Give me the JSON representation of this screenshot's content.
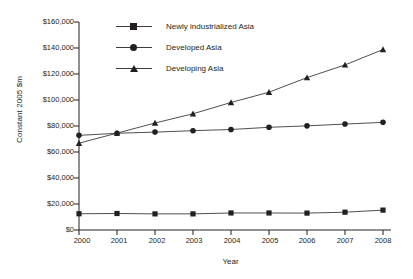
{
  "chart_data": {
    "type": "line",
    "title": "",
    "xlabel": "Year",
    "ylabel": "Constant 2005 $m",
    "x": [
      2000,
      2001,
      2002,
      2003,
      2004,
      2005,
      2006,
      2007,
      2008
    ],
    "xtick_labels": [
      "2000",
      "2001",
      "2002",
      "2003",
      "2004",
      "2005",
      "2006",
      "2007",
      "2008"
    ],
    "ytick_labels": [
      "$160,000",
      "$140,000",
      "$120,000",
      "$100,000",
      "$80,000",
      "$60,000",
      "$40,000",
      "$20,000",
      "$0"
    ],
    "ytick_values": [
      160000,
      140000,
      120000,
      100000,
      80000,
      60000,
      40000,
      20000,
      0
    ],
    "ylim": [
      0,
      160000
    ],
    "xlim": [
      2000,
      2008
    ],
    "grid": false,
    "legend_position": "top-center",
    "series": [
      {
        "name": "Newly industrialized Asia",
        "marker": "square",
        "color": "#231f20",
        "values": [
          12500,
          12700,
          12400,
          12400,
          13100,
          13100,
          13000,
          13700,
          15300
        ]
      },
      {
        "name": "Developed Asia",
        "marker": "circle",
        "color": "#231f20",
        "values": [
          72800,
          74400,
          75300,
          76400,
          77300,
          79000,
          80100,
          81500,
          82800
        ]
      },
      {
        "name": "Developing Asia",
        "marker": "triangle",
        "color": "#231f20",
        "values": [
          66800,
          74500,
          82300,
          89400,
          98100,
          106000,
          117200,
          127000,
          138800
        ]
      }
    ]
  },
  "legend": {
    "items": [
      {
        "label": "Newly industrialized Asia",
        "marker": "square"
      },
      {
        "label": "Developed Asia",
        "marker": "circle"
      },
      {
        "label": "Developing Asia",
        "marker": "triangle"
      }
    ]
  },
  "colors": {
    "axis": "#231f20",
    "line": "#3b3b3b",
    "marker": "#231f20",
    "background": "#ffffff"
  }
}
